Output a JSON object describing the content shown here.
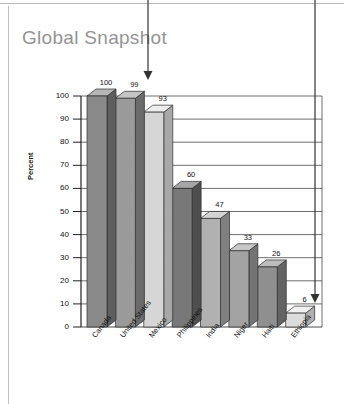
{
  "page": {
    "title": "Global Snapshot",
    "background_color": "#ffffff",
    "title_color": "#949494",
    "rule_color": "#b9b9b9"
  },
  "annotations": [
    {
      "name": "top-callout-arrow",
      "direction": "down",
      "x": 148,
      "y_start": 0,
      "y_end": 80
    },
    {
      "name": "right-callout-arrow",
      "direction": "down",
      "x": 315,
      "y_start": 0,
      "y_end": 303
    }
  ],
  "chart_data": {
    "type": "bar",
    "title": "Global Snapshot",
    "xlabel": "",
    "ylabel": "Percent",
    "ylim": [
      0,
      100
    ],
    "yticks": [
      0,
      10,
      20,
      30,
      40,
      50,
      60,
      70,
      80,
      90,
      100
    ],
    "grid": true,
    "legend": "none",
    "style": "3d-bars",
    "categories": [
      "Canada",
      "United States",
      "Mexico",
      "Philippines",
      "India",
      "Niger",
      "Haiti",
      "Ethiopia"
    ],
    "values": [
      100,
      99,
      93,
      60,
      47,
      33,
      26,
      6
    ],
    "data_labels": [
      "100",
      "99",
      "93",
      "60",
      "47",
      "33",
      "26",
      "6"
    ],
    "bar_face_colors": [
      "#8a8a8a",
      "#9a9a9a",
      "#d6d6d6",
      "#787878",
      "#b1b1b1",
      "#a3a3a3",
      "#8f8f8f",
      "#dcdcdc"
    ],
    "bar_top_colors": [
      "#b5b5b5",
      "#c4c4c4",
      "#ededed",
      "#a6a6a6",
      "#d4d4d4",
      "#c8c8c8",
      "#bcbcbc",
      "#f1f1f1"
    ],
    "bar_side_colors": [
      "#5e5e5e",
      "#6b6b6b",
      "#a8a8a8",
      "#4f4f4f",
      "#808080",
      "#747474",
      "#636363",
      "#b0b0b0"
    ]
  },
  "axis_tick_labels": [
    "100",
    "90",
    "80",
    "70",
    "60",
    "50",
    "40",
    "30",
    "20",
    "10",
    "0"
  ]
}
